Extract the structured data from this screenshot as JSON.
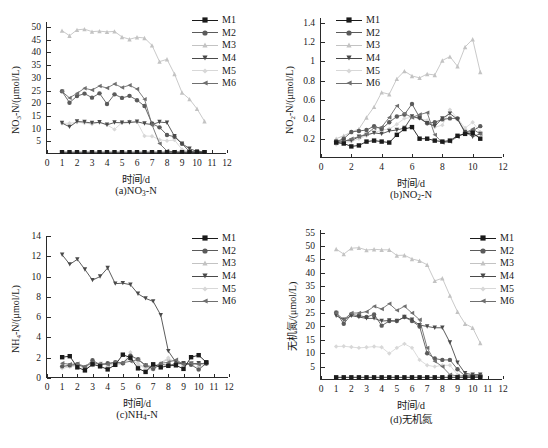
{
  "page": {
    "top_partial_text": "",
    "series_names": [
      "M1",
      "M2",
      "M3",
      "M4",
      "M5",
      "M6"
    ],
    "series_colors": [
      "#1b1b1b",
      "#5b5b5b",
      "#c3c3c3",
      "#4a4a4a",
      "#d8d8d8",
      "#6f6f6f"
    ],
    "series_markers": [
      "square",
      "circle",
      "triangle-up",
      "triangle-down",
      "diamond",
      "triangle-left"
    ]
  },
  "chart_data": [
    {
      "type": "line",
      "panel": "a",
      "title": "(a)NO₃-N",
      "xlabel": "时间/d",
      "ylabel": "NO₃-N/(μmol/L)",
      "xlim": [
        0,
        12
      ],
      "ylim": [
        0,
        52
      ],
      "xticks": [
        0,
        1,
        2,
        3,
        4,
        5,
        6,
        7,
        8,
        9,
        10,
        11,
        12
      ],
      "yticks": [
        5,
        10,
        15,
        20,
        25,
        30,
        35,
        40,
        45,
        50
      ],
      "grid": false,
      "legend_position": "top-right",
      "x": [
        1,
        1.5,
        2,
        2.5,
        3,
        3.5,
        4,
        4.5,
        5,
        5.5,
        6,
        6.5,
        7,
        7.5,
        8,
        8.5,
        9,
        9.5,
        10,
        10.5
      ],
      "series": [
        {
          "name": "M1",
          "values": [
            0.7,
            0.7,
            0.7,
            0.7,
            0.7,
            0.7,
            0.7,
            0.7,
            0.7,
            0.7,
            0.7,
            0.7,
            0.7,
            0.7,
            0.7,
            0.7,
            0.7,
            0.7,
            0.7,
            0.7
          ]
        },
        {
          "name": "M2",
          "values": [
            24.7,
            20.2,
            22.8,
            23.8,
            22.2,
            23.9,
            19.7,
            23.5,
            22.1,
            22.9,
            21.2,
            18.9,
            12.0,
            10.5,
            7.5,
            6.8,
            4.0,
            1.0,
            0.7,
            0.7
          ]
        },
        {
          "name": "M3",
          "values": [
            48.6,
            46.6,
            48.9,
            49.2,
            48.2,
            48.4,
            48.1,
            48.3,
            46.1,
            45.2,
            46.0,
            45.7,
            42.8,
            36.4,
            37.3,
            31.5,
            24.2,
            21.6,
            17.8,
            12.9
          ]
        },
        {
          "name": "M4",
          "values": [
            12.2,
            10.7,
            12.8,
            12.6,
            12.2,
            12.5,
            11.5,
            12.4,
            12.3,
            12.4,
            12.7,
            12.0,
            11.6,
            12.6,
            12.3,
            7.0,
            4.1,
            2.1,
            1.0,
            0.7
          ]
        },
        {
          "name": "M5",
          "values": [
            12.1,
            12.1,
            12.5,
            12.2,
            11.8,
            12.4,
            11.5,
            9.7,
            12.4,
            12.8,
            12.6,
            7.1,
            7.0,
            5.6,
            5.2,
            5.5,
            1.8,
            1.0,
            0.7,
            0.7
          ]
        },
        {
          "name": "M6",
          "values": [
            24.6,
            22.1,
            23.9,
            25.9,
            25.2,
            26.8,
            26.0,
            27.6,
            26.2,
            27.1,
            25.6,
            21.6,
            11.5,
            4.1,
            1.2,
            0.8,
            0.7,
            0.7,
            0.7,
            0.7
          ]
        }
      ]
    },
    {
      "type": "line",
      "panel": "b",
      "title": "(b)NO₂-N",
      "xlabel": "时间/d",
      "ylabel": "NO₂-N/(μmol/L)",
      "xlim": [
        0,
        12
      ],
      "ylim": [
        0,
        1.45
      ],
      "xticks": [
        0,
        2,
        4,
        6,
        8,
        10,
        12
      ],
      "yticks": [
        0.2,
        0.4,
        0.6,
        0.8,
        1.0,
        1.2,
        1.4
      ],
      "grid": false,
      "legend_position": "top-left",
      "x": [
        1,
        1.5,
        2,
        2.5,
        3,
        3.5,
        4,
        4.5,
        5,
        5.5,
        6,
        6.5,
        7,
        7.5,
        8,
        8.5,
        9,
        9.5,
        10,
        10.5
      ],
      "series": [
        {
          "name": "M1",
          "values": [
            0.16,
            0.15,
            0.12,
            0.13,
            0.17,
            0.18,
            0.17,
            0.16,
            0.24,
            0.3,
            0.32,
            0.2,
            0.2,
            0.18,
            0.17,
            0.18,
            0.23,
            0.25,
            0.26,
            0.2
          ]
        },
        {
          "name": "M2",
          "values": [
            0.17,
            0.2,
            0.27,
            0.28,
            0.29,
            0.33,
            0.3,
            0.37,
            0.43,
            0.45,
            0.56,
            0.42,
            0.36,
            0.37,
            0.4,
            0.41,
            0.41,
            0.26,
            0.28,
            0.33
          ]
        },
        {
          "name": "M3",
          "values": [
            0.2,
            0.23,
            0.27,
            0.3,
            0.42,
            0.53,
            0.68,
            0.66,
            0.82,
            0.9,
            0.85,
            0.83,
            0.87,
            0.86,
            1.01,
            1.05,
            0.95,
            1.15,
            1.23,
            0.89
          ]
        },
        {
          "name": "M4",
          "values": [
            0.17,
            0.18,
            0.18,
            0.22,
            0.24,
            0.26,
            0.25,
            0.28,
            0.29,
            0.31,
            0.43,
            0.41,
            0.36,
            0.33,
            0.41,
            0.46,
            0.4,
            0.27,
            0.22,
            0.25
          ]
        },
        {
          "name": "M5",
          "values": [
            0.14,
            0.16,
            0.17,
            0.2,
            0.23,
            0.26,
            0.29,
            0.3,
            0.35,
            0.41,
            0.42,
            0.41,
            0.39,
            0.32,
            0.34,
            0.5,
            0.41,
            0.31,
            0.37,
            0.27
          ]
        },
        {
          "name": "M6",
          "values": [
            0.16,
            0.17,
            0.2,
            0.22,
            0.25,
            0.31,
            0.32,
            0.42,
            0.54,
            0.46,
            0.42,
            0.45,
            0.47,
            0.24,
            0.16,
            0.17,
            0.22,
            0.26,
            0.3,
            0.25
          ]
        }
      ]
    },
    {
      "type": "line",
      "panel": "c",
      "title": "(c)NH₄-N",
      "xlabel": "时间/d",
      "ylabel": "NH₄-N/(μmol/L)",
      "xlim": [
        0,
        12
      ],
      "ylim": [
        0,
        14
      ],
      "xticks": [
        0,
        1,
        2,
        3,
        4,
        5,
        6,
        7,
        8,
        9,
        10,
        11,
        12
      ],
      "yticks": [
        0,
        2,
        4,
        6,
        8,
        10,
        12,
        14
      ],
      "grid": false,
      "legend_position": "top-right",
      "x": [
        1,
        1.5,
        2,
        2.5,
        3,
        3.5,
        4,
        4.5,
        5,
        5.5,
        6,
        6.5,
        7,
        7.5,
        8,
        8.5,
        9,
        9.5,
        10,
        10.5
      ],
      "series": [
        {
          "name": "M1",
          "values": [
            2.05,
            2.15,
            1.05,
            0.75,
            1.35,
            1.15,
            0.85,
            1.3,
            2.3,
            2.0,
            0.95,
            0.6,
            1.35,
            1.05,
            1.2,
            1.25,
            0.9,
            2.05,
            2.25,
            1.55
          ]
        },
        {
          "name": "M2",
          "values": [
            1.15,
            1.25,
            1.35,
            1.05,
            1.75,
            1.3,
            1.45,
            1.55,
            1.45,
            2.2,
            1.85,
            1.25,
            0.9,
            1.35,
            1.25,
            1.4,
            1.45,
            1.3,
            0.85,
            1.45
          ]
        },
        {
          "name": "M3",
          "values": [
            1.1,
            1.2,
            1.25,
            1.1,
            1.45,
            1.35,
            1.3,
            1.4,
            1.5,
            1.95,
            1.35,
            1.05,
            0.9,
            1.45,
            1.9,
            1.5,
            1.35,
            1.4,
            1.3,
            1.4
          ]
        },
        {
          "name": "M4",
          "values": [
            12.15,
            11.2,
            11.7,
            10.7,
            9.65,
            10.0,
            10.85,
            9.3,
            9.35,
            9.2,
            8.3,
            7.85,
            7.55,
            6.2,
            2.65,
            1.55,
            1.45,
            1.4,
            1.45,
            1.4
          ]
        },
        {
          "name": "M5",
          "values": [
            0.95,
            1.1,
            1.2,
            1.0,
            1.25,
            1.45,
            1.3,
            1.25,
            1.4,
            2.55,
            1.45,
            0.85,
            0.8,
            1.5,
            2.0,
            1.5,
            1.2,
            1.5,
            0.75,
            1.45
          ]
        },
        {
          "name": "M6",
          "values": [
            1.45,
            1.35,
            1.4,
            1.15,
            1.5,
            1.4,
            1.35,
            1.55,
            1.5,
            1.65,
            1.8,
            1.25,
            1.1,
            1.45,
            1.55,
            1.8,
            1.35,
            1.45,
            1.35,
            1.5
          ]
        }
      ]
    },
    {
      "type": "line",
      "panel": "d",
      "title": "(d)无机氮",
      "xlabel": "时间/d",
      "ylabel": "无机氮/(μmol/L)",
      "xlim": [
        0,
        12
      ],
      "ylim": [
        0,
        56
      ],
      "xticks": [
        0,
        1,
        2,
        3,
        4,
        5,
        6,
        7,
        8,
        9,
        10,
        11,
        12
      ],
      "yticks": [
        5,
        10,
        15,
        20,
        25,
        30,
        35,
        40,
        45,
        50,
        55
      ],
      "grid": false,
      "legend_position": "top-right",
      "x": [
        1,
        1.5,
        2,
        2.5,
        3,
        3.5,
        4,
        4.5,
        5,
        5.5,
        6,
        6.5,
        7,
        7.5,
        8,
        8.5,
        9,
        9.5,
        10,
        10.5
      ],
      "series": [
        {
          "name": "M1",
          "values": [
            1.0,
            1.0,
            1.0,
            1.0,
            1.0,
            1.0,
            1.0,
            1.0,
            1.0,
            1.0,
            1.0,
            1.0,
            1.0,
            1.0,
            1.0,
            1.0,
            1.0,
            1.0,
            1.0,
            1.0
          ]
        },
        {
          "name": "M2",
          "values": [
            25.2,
            21.0,
            24.5,
            24.0,
            23.5,
            24.5,
            20.3,
            22.0,
            22.0,
            23.5,
            22.0,
            20.0,
            10.0,
            8.0,
            7.5,
            7.5,
            4.0,
            1.5,
            1.5,
            1.5
          ]
        },
        {
          "name": "M3",
          "values": [
            48.9,
            47.0,
            49.2,
            49.4,
            48.5,
            48.8,
            48.6,
            48.6,
            46.5,
            46.6,
            45.2,
            44.5,
            43.0,
            37.0,
            38.0,
            31.5,
            25.5,
            21.0,
            19.5,
            13.8
          ]
        },
        {
          "name": "M4",
          "values": [
            24.0,
            22.5,
            24.0,
            23.5,
            23.0,
            23.0,
            22.0,
            22.2,
            22.0,
            23.5,
            22.5,
            20.5,
            20.0,
            19.5,
            19.5,
            14.0,
            6.5,
            2.5,
            2.0,
            2.0
          ]
        },
        {
          "name": "M5",
          "values": [
            12.5,
            12.6,
            12.3,
            12.0,
            12.2,
            12.5,
            12.2,
            9.9,
            12.0,
            13.5,
            12.0,
            7.5,
            5.5,
            5.0,
            5.5,
            5.5,
            2.0,
            1.5,
            1.5,
            1.5
          ]
        },
        {
          "name": "M6",
          "values": [
            25.0,
            22.5,
            25.0,
            25.0,
            25.5,
            27.5,
            26.5,
            28.5,
            26.0,
            27.5,
            25.0,
            22.5,
            12.0,
            7.0,
            5.0,
            2.0,
            1.5,
            1.5,
            1.5,
            1.5
          ]
        }
      ]
    }
  ]
}
